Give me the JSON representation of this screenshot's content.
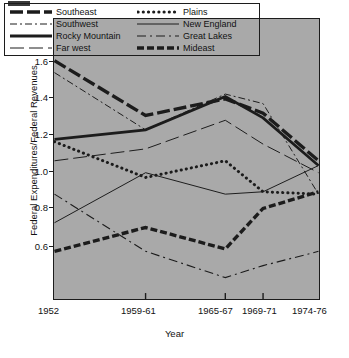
{
  "page": {
    "corner_artifact": "...",
    "background": "#ffffff"
  },
  "chart_data": {
    "type": "line",
    "title": "",
    "xlabel": "Year",
    "ylabel": "Federal Expenditures/Federal Revenues",
    "categories": [
      "1952",
      "1959-61",
      "1965-67",
      "1969-71",
      "1974-76"
    ],
    "x_tick_labels": [
      "1952",
      "1959-61",
      "1965-67",
      "1969-71",
      "1974-76"
    ],
    "y_tick_labels": [
      "0.6",
      "0.8",
      "1.0",
      "1.2",
      "1.4",
      "1.6"
    ],
    "y_ticks": [
      0.6,
      0.8,
      1.0,
      1.2,
      1.4,
      1.6
    ],
    "ylim": [
      0.52,
      1.695
    ],
    "xlim": [
      0,
      4
    ],
    "grid": false,
    "legend_position": "top-inside",
    "plot_background": "#a9a9a9",
    "line_color": "#1c1c1c",
    "series": [
      {
        "name": "Southeast",
        "style": "thick-dashed",
        "values": [
          1.52,
          1.29,
          1.36,
          1.3,
          1.1
        ]
      },
      {
        "name": "Southwest",
        "style": "thin-dash-dot",
        "values": [
          1.47,
          1.23,
          1.38,
          1.34,
          0.96
        ]
      },
      {
        "name": "Rocky Mountain",
        "style": "thick-solid",
        "values": [
          1.19,
          1.23,
          1.37,
          1.28,
          1.08
        ]
      },
      {
        "name": "Far west",
        "style": "thin-long-dash",
        "values": [
          1.1,
          1.15,
          1.27,
          1.17,
          1.05
        ]
      },
      {
        "name": "Plains",
        "style": "thick-dotted",
        "values": [
          1.18,
          1.03,
          1.1,
          0.97,
          0.96
        ]
      },
      {
        "name": "New England",
        "style": "thin-solid",
        "values": [
          0.84,
          1.05,
          0.96,
          0.97,
          1.08
        ]
      },
      {
        "name": "Great Lakes",
        "style": "thin-dash-dot-long",
        "values": [
          0.96,
          0.72,
          0.61,
          0.66,
          0.72
        ]
      },
      {
        "name": "Mideast",
        "style": "thick-dashed-short",
        "values": [
          0.72,
          0.82,
          0.73,
          0.9,
          0.97
        ]
      }
    ]
  },
  "legend": {
    "left_column": [
      "Southeast",
      "Southwest",
      "Rocky Mountain",
      "Far west"
    ],
    "right_column": [
      "Plains",
      "New England",
      "Great Lakes",
      "Mideast"
    ]
  }
}
